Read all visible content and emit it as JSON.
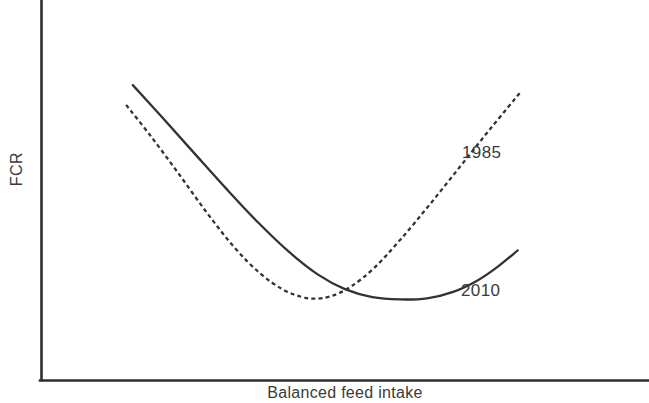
{
  "chart_data": {
    "type": "line",
    "title": "",
    "subtitle": "",
    "xlabel": "Balanced feed intake",
    "ylabel": "FCR",
    "grid": false,
    "legend_position": "inline-right-of-curve-ends",
    "axis_style": "open-L (left spine and bottom spine only, no ticks, no tick labels)",
    "xlim": [
      0,
      1
    ],
    "ylim": [
      0,
      1
    ],
    "axis_ticks": [],
    "annotations": [
      {
        "text": "1985",
        "x": 0.694,
        "y": 0.758
      },
      {
        "text": "2010",
        "x": 0.692,
        "y": 0.408
      }
    ],
    "series": [
      {
        "name": "1985",
        "label": "1985",
        "style": "dashed",
        "color": "#333333",
        "points": [
          {
            "x": 0.14,
            "y": 0.724
          },
          {
            "x": 0.18,
            "y": 0.643
          },
          {
            "x": 0.225,
            "y": 0.546
          },
          {
            "x": 0.272,
            "y": 0.442
          },
          {
            "x": 0.318,
            "y": 0.349
          },
          {
            "x": 0.36,
            "y": 0.281
          },
          {
            "x": 0.398,
            "y": 0.238
          },
          {
            "x": 0.428,
            "y": 0.219
          },
          {
            "x": 0.452,
            "y": 0.214
          },
          {
            "x": 0.478,
            "y": 0.221
          },
          {
            "x": 0.51,
            "y": 0.246
          },
          {
            "x": 0.548,
            "y": 0.295
          },
          {
            "x": 0.592,
            "y": 0.371
          },
          {
            "x": 0.64,
            "y": 0.463
          },
          {
            "x": 0.69,
            "y": 0.563
          },
          {
            "x": 0.74,
            "y": 0.663
          },
          {
            "x": 0.79,
            "y": 0.76
          }
        ]
      },
      {
        "name": "2010",
        "label": "2010",
        "style": "solid",
        "color": "#333333",
        "points": [
          {
            "x": 0.151,
            "y": 0.776
          },
          {
            "x": 0.2,
            "y": 0.69
          },
          {
            "x": 0.252,
            "y": 0.597
          },
          {
            "x": 0.305,
            "y": 0.503
          },
          {
            "x": 0.358,
            "y": 0.413
          },
          {
            "x": 0.408,
            "y": 0.337
          },
          {
            "x": 0.455,
            "y": 0.278
          },
          {
            "x": 0.5,
            "y": 0.239
          },
          {
            "x": 0.545,
            "y": 0.218
          },
          {
            "x": 0.59,
            "y": 0.212
          },
          {
            "x": 0.635,
            "y": 0.215
          },
          {
            "x": 0.678,
            "y": 0.232
          },
          {
            "x": 0.718,
            "y": 0.262
          },
          {
            "x": 0.752,
            "y": 0.299
          },
          {
            "x": 0.784,
            "y": 0.341
          }
        ]
      }
    ]
  },
  "axes": {
    "y_axis_label": "FCR",
    "x_axis_label": "Balanced feed intake"
  },
  "labels": {
    "series_1985": "1985",
    "series_2010": "2010"
  },
  "colors": {
    "curve": "#333333",
    "axis": "#2e2e2e",
    "text": "#3a3a3a",
    "background": "#ffffff"
  }
}
